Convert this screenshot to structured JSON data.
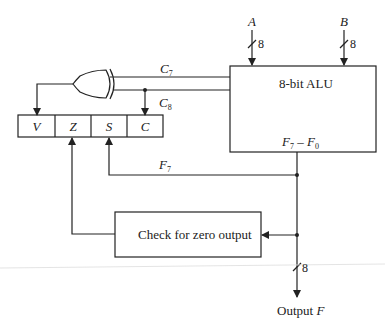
{
  "diagram": {
    "alu": {
      "title": "8-bit ALU",
      "output_label_main": "F",
      "output_sub1": "7",
      "output_sep": " – ",
      "output_label_end": "F",
      "output_sub2": "0"
    },
    "inputs": [
      {
        "name": "A",
        "width": "8"
      },
      {
        "name": "B",
        "width": "8"
      }
    ],
    "carries": [
      {
        "main": "C",
        "sub": "7"
      },
      {
        "main": "C",
        "sub": "8"
      }
    ],
    "status_register": {
      "cells": [
        "V",
        "Z",
        "S",
        "C"
      ]
    },
    "sign_line": {
      "main": "F",
      "sub": "7"
    },
    "zero_check": {
      "label": "Check for zero output"
    },
    "output": {
      "width": "8",
      "label": "Output ",
      "var": "F"
    },
    "colors": {
      "line": "#222222",
      "background": "#ffffff",
      "faint_rule": "#dddddd"
    }
  }
}
